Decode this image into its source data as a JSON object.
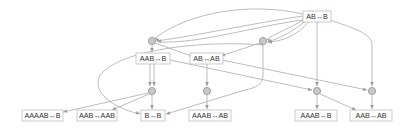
{
  "diagram": {
    "type": "multiway-rewrite-graph",
    "colors": {
      "edge": "#b4b4b4",
      "box_border": "#bdbdbd",
      "hub_fill": "#c8c8c8",
      "hub_stroke": "#8f8f8f",
      "text": "#333333"
    },
    "states": [
      {
        "id": "s_ab_b",
        "label": "AB↔B",
        "x": 303,
        "y": 11,
        "w": 28,
        "h": 11
      },
      {
        "id": "s_aab_b",
        "label": "AAB↔B",
        "x": 136,
        "y": 53,
        "w": 34,
        "h": 11
      },
      {
        "id": "s_ab_ab",
        "label": "AB↔AB",
        "x": 190,
        "y": 53,
        "w": 33,
        "h": 11
      },
      {
        "id": "s_aaaab_b",
        "label": "AAAAB↔B",
        "x": 22,
        "y": 110,
        "w": 41,
        "h": 11
      },
      {
        "id": "s_aab_aab",
        "label": "AAB↔AAB",
        "x": 77,
        "y": 110,
        "w": 40,
        "h": 11
      },
      {
        "id": "s_b_b",
        "label": "B↔B",
        "x": 141,
        "y": 110,
        "w": 24,
        "h": 11
      },
      {
        "id": "s_aaab_ab",
        "label": "AAAB↔AB",
        "x": 189,
        "y": 110,
        "w": 42,
        "h": 11
      },
      {
        "id": "s_aaab_b",
        "label": "AAAB↔B",
        "x": 295,
        "y": 110,
        "w": 42,
        "h": 11
      },
      {
        "id": "s_aab_ab",
        "label": "AAB↔AB",
        "x": 350,
        "y": 110,
        "w": 42,
        "h": 11
      }
    ],
    "events": [
      {
        "id": "e1",
        "x": 152,
        "y": 41
      },
      {
        "id": "e2",
        "x": 263,
        "y": 41
      },
      {
        "id": "e3",
        "x": 152,
        "y": 91
      },
      {
        "id": "e4",
        "x": 207,
        "y": 91
      },
      {
        "id": "e5",
        "x": 317,
        "y": 91
      },
      {
        "id": "e6",
        "x": 372,
        "y": 91
      }
    ],
    "edges": [
      {
        "d": "M303,14 C250,2 190,12 155,38"
      },
      {
        "d": "M303,16 C260,22 200,35 157,41"
      },
      {
        "d": "M305,19 C290,28 275,34 267,39"
      },
      {
        "d": "M307,20 C292,32 280,38 268,42"
      },
      {
        "d": "M309,21 C298,36 280,42 267,42"
      },
      {
        "d": "M303,20 C255,26 200,44 158,42"
      },
      {
        "d": "M317,22 L317,86"
      },
      {
        "d": "M330,20 C360,30 372,35 372,45 L372,86"
      },
      {
        "d": "M152,45 L152,52"
      },
      {
        "d": "M155,43 L194,57"
      },
      {
        "d": "M260,43 L221,56"
      },
      {
        "d": "M263,45 L263,75 C263,85 255,88 245,90 L166,114"
      },
      {
        "d": "M263,45 C200,40 120,50 100,75 C90,95 120,110 140,114"
      },
      {
        "d": "M150,64 L150,86"
      },
      {
        "d": "M154,64 L154,86"
      },
      {
        "d": "M170,60 L312,90"
      },
      {
        "d": "M207,64 L207,86"
      },
      {
        "d": "M222,60 L367,90"
      },
      {
        "d": "M148,93 L63,112"
      },
      {
        "d": "M149,94 L112,110"
      },
      {
        "d": "M152,95 L152,109"
      },
      {
        "d": "M207,95 L207,109"
      },
      {
        "d": "M317,95 L317,109"
      },
      {
        "d": "M320,94 L356,110"
      },
      {
        "d": "M372,95 L372,109"
      }
    ],
    "arrow_heads": [
      {
        "x": 155,
        "y": 38,
        "angle": 215
      },
      {
        "x": 157,
        "y": 41,
        "angle": 180
      },
      {
        "x": 267,
        "y": 39,
        "angle": 210
      },
      {
        "x": 268,
        "y": 42,
        "angle": 180
      },
      {
        "x": 317,
        "y": 86,
        "angle": 90
      },
      {
        "x": 372,
        "y": 86,
        "angle": 90
      },
      {
        "x": 152,
        "y": 52,
        "angle": 90
      },
      {
        "x": 194,
        "y": 57,
        "angle": 20
      },
      {
        "x": 221,
        "y": 56,
        "angle": 160
      },
      {
        "x": 166,
        "y": 114,
        "angle": 165
      },
      {
        "x": 140,
        "y": 114,
        "angle": 20
      },
      {
        "x": 150,
        "y": 86,
        "angle": 90
      },
      {
        "x": 154,
        "y": 86,
        "angle": 90
      },
      {
        "x": 312,
        "y": 90,
        "angle": 12
      },
      {
        "x": 207,
        "y": 86,
        "angle": 90
      },
      {
        "x": 367,
        "y": 90,
        "angle": 12
      },
      {
        "x": 63,
        "y": 112,
        "angle": 167
      },
      {
        "x": 112,
        "y": 110,
        "angle": 157
      },
      {
        "x": 152,
        "y": 109,
        "angle": 90
      },
      {
        "x": 207,
        "y": 109,
        "angle": 90
      },
      {
        "x": 317,
        "y": 109,
        "angle": 90
      },
      {
        "x": 356,
        "y": 110,
        "angle": 24
      },
      {
        "x": 372,
        "y": 109,
        "angle": 90
      }
    ]
  }
}
